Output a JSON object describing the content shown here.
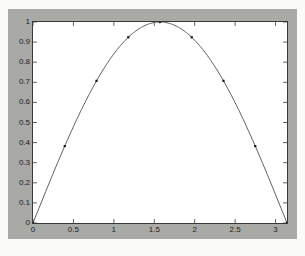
{
  "figure": {
    "background_color": "#a9a9a6",
    "axes_background_color": "#ffffff",
    "axes_border_color": "#3a3a3a"
  },
  "bleed_text": [
    {
      "text": "这里是一个正弦函数的图像",
      "x": 176,
      "y": 40
    },
    {
      "text": "绘制函数曲线",
      "x": 196,
      "y": 52
    },
    {
      "text": "使用 plot 命令绘图，观察曲线形状与变化趋势",
      "x": 14,
      "y": 130
    },
    {
      "text": "投影变换",
      "x": 216,
      "y": 186
    }
  ],
  "chart_data": {
    "type": "line",
    "title": "",
    "xlabel": "",
    "ylabel": "",
    "xlim": [
      0,
      3.14159265
    ],
    "ylim": [
      0,
      1
    ],
    "grid": false,
    "legend": null,
    "line_color": "#4a4a4a",
    "line_width": 0.9,
    "marker": "square",
    "marker_color": "#111111",
    "marker_size": 2.2,
    "x_ticks": [
      0,
      0.5,
      1,
      1.5,
      2,
      2.5,
      3
    ],
    "x_tick_labels": [
      "0",
      "0.5",
      "1",
      "1.5",
      "2",
      "2.5",
      "3"
    ],
    "y_ticks": [
      0,
      0.1,
      0.2,
      0.3,
      0.4,
      0.5,
      0.6,
      0.7,
      0.8,
      0.9,
      1
    ],
    "y_tick_labels": [
      "0",
      "0.1",
      "0.2",
      "0.3",
      "0.4",
      "0.5",
      "0.6",
      "0.7",
      "0.8",
      "0.9",
      "1"
    ],
    "series": [
      {
        "name": "sin(x)",
        "expression": "sin(x)",
        "x": [
          0,
          0.3926991,
          0.7853982,
          1.1780972,
          1.5707963,
          1.9634954,
          2.3561945,
          2.7488936,
          3.1415927
        ],
        "values": [
          0,
          0.3826834,
          0.7071068,
          0.9238795,
          1,
          0.9238795,
          0.7071068,
          0.3826834,
          0
        ]
      }
    ]
  }
}
